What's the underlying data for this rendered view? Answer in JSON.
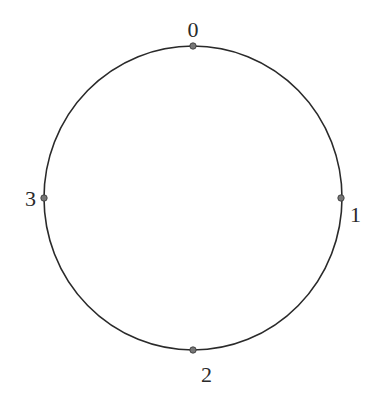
{
  "diagram": {
    "type": "circle-with-labeled-points",
    "circle": {
      "cx": 193,
      "cy": 198,
      "rx": 149,
      "ry": 152,
      "stroke": "#2a2a2a"
    },
    "points": [
      {
        "label": "0",
        "x": 193,
        "y": 46,
        "label_x": 193,
        "label_y": 37,
        "anchor": "middle"
      },
      {
        "label": "1",
        "x": 341,
        "y": 198,
        "label_x": 350,
        "label_y": 222,
        "anchor": "start"
      },
      {
        "label": "2",
        "x": 193,
        "y": 350,
        "label_x": 201,
        "label_y": 382,
        "anchor": "start"
      },
      {
        "label": "3",
        "x": 44,
        "y": 198,
        "label_x": 36,
        "label_y": 206,
        "anchor": "end"
      }
    ],
    "point_color": "#777777"
  }
}
